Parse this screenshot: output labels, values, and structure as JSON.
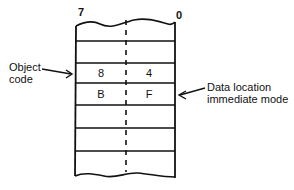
{
  "diagram": {
    "bit_labels": {
      "high": "7",
      "low": "0"
    },
    "rows": [
      {
        "high": "",
        "low": ""
      },
      {
        "high": "8",
        "low": "4"
      },
      {
        "high": "B",
        "low": "F"
      },
      {
        "high": "",
        "low": ""
      },
      {
        "high": "",
        "low": ""
      },
      {
        "high": "",
        "low": ""
      }
    ],
    "annotations": {
      "left": {
        "line1": "Object",
        "line2": "code"
      },
      "right": {
        "line1": "Data location",
        "line2": "immediate mode"
      }
    }
  }
}
